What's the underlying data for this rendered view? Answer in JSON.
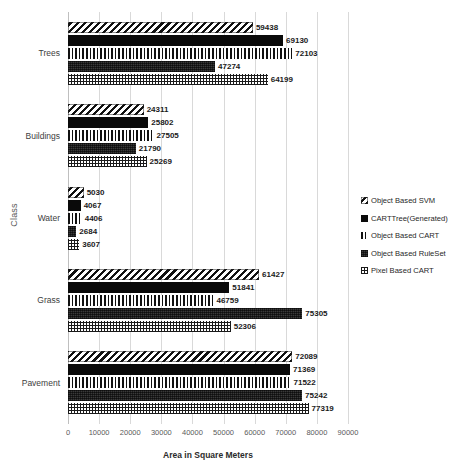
{
  "chart_data": {
    "type": "bar",
    "orientation": "horizontal",
    "title": "",
    "xlabel": "Area in Square Meters",
    "ylabel": "Class",
    "categories": [
      "Trees",
      "Buildings",
      "Water",
      "Grass",
      "Pavement"
    ],
    "series": [
      {
        "name": "Object Based SVM",
        "pattern": "diagonal-stripes",
        "values": [
          59438,
          24311,
          5030,
          61427,
          72089
        ]
      },
      {
        "name": "CARTTree(Generated)",
        "pattern": "solid-black",
        "values": [
          69130,
          25802,
          4067,
          51841,
          71369
        ]
      },
      {
        "name": "Object Based CART",
        "pattern": "vertical-stripes",
        "values": [
          72103,
          27505,
          4406,
          46759,
          71522
        ]
      },
      {
        "name": "Object Based RuleSet",
        "pattern": "dense-dark",
        "values": [
          47274,
          21790,
          2684,
          75305,
          75242
        ]
      },
      {
        "name": "Pixel Based CART",
        "pattern": "crosshatch-grid",
        "values": [
          64199,
          25269,
          3607,
          52306,
          77319
        ]
      }
    ],
    "xlim": [
      0,
      90000
    ],
    "xticks": [
      0,
      10000,
      20000,
      30000,
      40000,
      50000,
      60000,
      70000,
      80000,
      90000
    ],
    "xtick_labels": [
      "0",
      "10000",
      "20000",
      "30000",
      "40000",
      "50000",
      "60000",
      "70000",
      "80000",
      "90000"
    ],
    "grid": true,
    "grid_axis": "x",
    "legend_position": "right",
    "data_labels": true
  },
  "legend": {
    "items": [
      {
        "label": "Object Based SVM",
        "swatch": "diagonal-stripes-swatch"
      },
      {
        "label": "CARTTree(Generated)",
        "swatch": "solid-black-swatch"
      },
      {
        "label": "Object Based CART",
        "swatch": "vertical-stripes-swatch"
      },
      {
        "label": "Object Based RuleSet",
        "swatch": "dense-dark-swatch"
      },
      {
        "label": "Pixel Based CART",
        "swatch": "crosshatch-grid-swatch"
      }
    ]
  },
  "colors": {
    "bar_ink": "#0a0a0a",
    "dense_fill": "#3a3a3a",
    "gridline": "#d9d9d9",
    "axis_text": "#5a5a5a",
    "label_text": "#1a1a1a",
    "background": "#ffffff"
  }
}
